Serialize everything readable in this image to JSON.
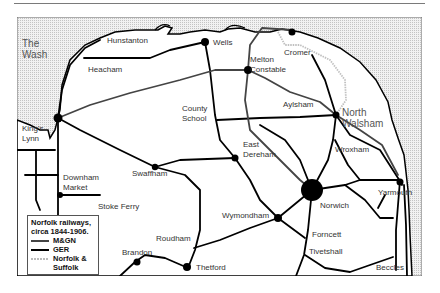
{
  "map": {
    "title": "Norfolk railways, circa 1844-1906.",
    "colors": {
      "sea": "#e4e4e4",
      "land": "#ffffff",
      "mgn": "#444444",
      "ger": "#000000",
      "norfolk_suffolk": "#c8c8c8",
      "frame": "#666666"
    },
    "sea_label": {
      "line1": "The",
      "line2": "Wash"
    },
    "places": [
      {
        "name": "Hunstanton"
      },
      {
        "name": "Wells"
      },
      {
        "name": "Cromer"
      },
      {
        "name": "Heacham"
      },
      {
        "name": "Melton",
        "name2": "Constable"
      },
      {
        "name": "County",
        "name2": "School"
      },
      {
        "name": "Aylsham"
      },
      {
        "name": "North",
        "name2": "Walsham"
      },
      {
        "name": "King's",
        "name2": "Lynn"
      },
      {
        "name": "East",
        "name2": "Dereham"
      },
      {
        "name": "Wroxham"
      },
      {
        "name": "Swaffham"
      },
      {
        "name": "Downham",
        "name2": "Market"
      },
      {
        "name": "Stoke Ferry"
      },
      {
        "name": "Norwich"
      },
      {
        "name": "Yarmouth"
      },
      {
        "name": "Wymondham"
      },
      {
        "name": "Roudham"
      },
      {
        "name": "Forncett"
      },
      {
        "name": "Brandon"
      },
      {
        "name": "Tivetshall"
      },
      {
        "name": "Thetford"
      },
      {
        "name": "Beccles"
      }
    ],
    "legend": {
      "title_line1": "Norfolk railways,",
      "title_line2": "circa 1844-1906.",
      "items": [
        {
          "label": "M&GN"
        },
        {
          "label": "GER"
        },
        {
          "label": "Norfolk &",
          "label2": "Suffolk"
        }
      ]
    }
  }
}
